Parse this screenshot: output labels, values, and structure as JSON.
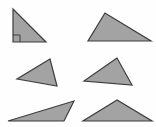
{
  "figure": {
    "canvas": {
      "width": 156,
      "height": 127,
      "background_color": "#fefefe"
    },
    "style": {
      "fill_color": "#a3a3a3",
      "stroke_color": "#3d3d3d",
      "stroke_width": 1.2,
      "marker_stroke_color": "#3d3d3d",
      "marker_stroke_width": 1
    },
    "shapes": [
      {
        "id": "triangle-top-left",
        "name": "right-triangle",
        "label": "right triangle",
        "row": 1,
        "column": 1,
        "points": "13,9 13,42 46,42",
        "vertices": [
          [
            13,
            9
          ],
          [
            13,
            42
          ],
          [
            46,
            42
          ]
        ],
        "has_right_angle_marker": true,
        "right_angle_marker_points": "13,35 20,35 20,42",
        "right_angle_vertex": [
          13,
          42
        ]
      },
      {
        "id": "triangle-top-right",
        "name": "obtuse-triangle-wide",
        "label": "scalene triangle",
        "row": 1,
        "column": 2,
        "points": "105,13 88,41 151,41",
        "vertices": [
          [
            105,
            13
          ],
          [
            88,
            41
          ],
          [
            151,
            41
          ]
        ],
        "has_right_angle_marker": false
      },
      {
        "id": "triangle-middle-left",
        "name": "scalene-triangle-left-point",
        "label": "scalene triangle",
        "row": 2,
        "column": 1,
        "points": "50,59 17,79 57,86",
        "vertices": [
          [
            50,
            59
          ],
          [
            17,
            79
          ],
          [
            57,
            86
          ]
        ],
        "has_right_angle_marker": false
      },
      {
        "id": "triangle-middle-right",
        "name": "scalene-triangle-right",
        "label": "scalene triangle",
        "row": 2,
        "column": 2,
        "points": "117,58 84,81 132,85",
        "vertices": [
          [
            117,
            58
          ],
          [
            84,
            81
          ],
          [
            132,
            85
          ]
        ],
        "has_right_angle_marker": false
      },
      {
        "id": "triangle-bottom-left",
        "name": "thin-obtuse-triangle",
        "label": "obtuse triangle",
        "row": 3,
        "column": 1,
        "points": "74,101 8,121 64,121",
        "vertices": [
          [
            74,
            101
          ],
          [
            8,
            121
          ],
          [
            64,
            121
          ]
        ],
        "has_right_angle_marker": false
      },
      {
        "id": "triangle-bottom-right",
        "name": "wide-isosceles-triangle",
        "label": "isosceles triangle",
        "row": 3,
        "column": 2,
        "points": "117,100 83,121 152,121",
        "vertices": [
          [
            117,
            100
          ],
          [
            83,
            121
          ],
          [
            152,
            121
          ]
        ],
        "has_right_angle_marker": false
      }
    ]
  }
}
